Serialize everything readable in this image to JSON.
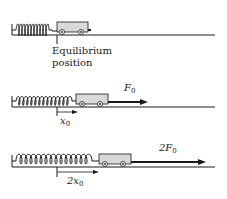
{
  "diagram": {
    "colors": {
      "ink": "#1a1a1a",
      "cart_fill": "#d9d9d9",
      "background": "#ffffff"
    },
    "panels": [
      {
        "id": "equilibrium",
        "label_line1": "Equilibrium",
        "label_line2": "position"
      },
      {
        "id": "force-f0",
        "force_label": "F",
        "force_sub": "0",
        "displacement_label": "x",
        "displacement_sub": "0"
      },
      {
        "id": "force-2f0",
        "force_label": "2F",
        "force_sub": "0",
        "displacement_label": "2x",
        "displacement_sub": "0"
      }
    ]
  }
}
